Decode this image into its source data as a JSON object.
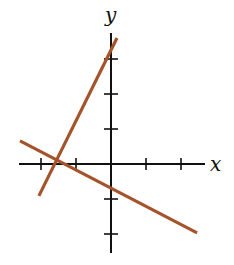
{
  "chart_data": {
    "type": "line",
    "title": "",
    "xlabel": "x",
    "ylabel": "y",
    "xlim": [
      -2.6,
      2.7
    ],
    "ylim": [
      -2.5,
      3.7
    ],
    "grid": false,
    "legend": null,
    "x_ticks": [
      -2,
      -1,
      1,
      2
    ],
    "y_ticks": [
      -2,
      -1,
      1,
      2,
      3
    ],
    "tick_labels_shown": false,
    "series": [
      {
        "name": "steep line",
        "equation": "y = 2x + 3",
        "color": "#a4532a",
        "x": [
          -2.06,
          0.17
        ],
        "y": [
          -0.91,
          3.6
        ]
      },
      {
        "name": "shallow line",
        "equation": "y = -0.5x - 0.75",
        "color": "#a4532a",
        "x": [
          -2.6,
          2.46
        ],
        "y": [
          0.66,
          -1.97
        ]
      }
    ],
    "annotations": [
      {
        "text": "lines intersect on x-axis",
        "x": -1.5,
        "y": 0
      }
    ]
  },
  "labels": {
    "x_axis": "x",
    "y_axis": "y"
  },
  "layout": {
    "origin_px": [
      111,
      164
    ],
    "unit_px": 35,
    "x_axis_px": [
      19,
      205
    ],
    "y_axis_px": [
      33,
      253
    ]
  }
}
